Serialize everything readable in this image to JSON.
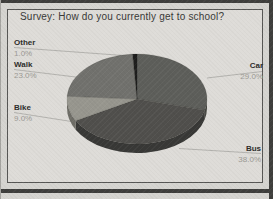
{
  "chart_data": {
    "type": "pie",
    "style": "3d",
    "title": "Survey: How do you currently get to school?",
    "categories": [
      "Car",
      "Bus",
      "Bike",
      "Walk",
      "Other"
    ],
    "values": [
      29.0,
      38.0,
      9.0,
      23.0,
      1.0
    ],
    "unit": "%",
    "start_angle_deg": 0,
    "direction": "clockwise",
    "legend_position": "none",
    "label_style": "callouts-with-leader-lines",
    "colors": [
      "#5d5e5a",
      "#504f4c",
      "#97968e",
      "#71716d",
      "#1e1e1d"
    ],
    "side_colors": [
      "#454641",
      "#383836",
      "#6e6d66",
      "#525250",
      "#121211"
    ],
    "background_color": "#dedcd8",
    "frame_color": "#565654",
    "callouts": [
      {
        "name": "Other",
        "pct": "1.0%"
      },
      {
        "name": "Walk",
        "pct": "23.0%"
      },
      {
        "name": "Bike",
        "pct": "9.0%"
      },
      {
        "name": "Car",
        "pct": "29.0%"
      },
      {
        "name": "Bus",
        "pct": "38.0%"
      }
    ]
  }
}
